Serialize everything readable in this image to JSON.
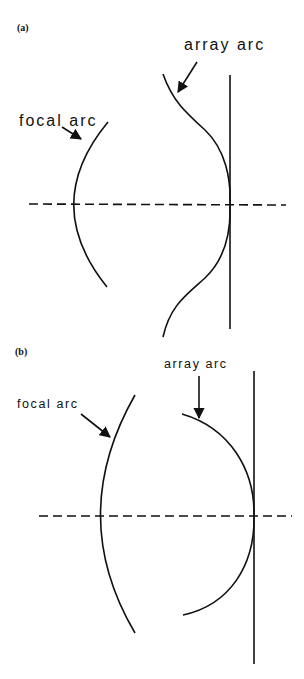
{
  "figure": {
    "panels": [
      {
        "id": "a",
        "label": "(a)",
        "labels": {
          "focal_arc": "focal arc",
          "array_arc": "array arc"
        }
      },
      {
        "id": "b",
        "label": "(b)",
        "labels": {
          "focal_arc": "focal arc",
          "array_arc": "array arc"
        }
      }
    ],
    "colors": {
      "stroke": "#111111",
      "background": "#ffffff"
    }
  }
}
